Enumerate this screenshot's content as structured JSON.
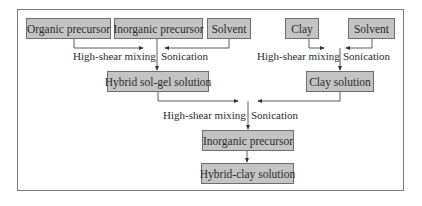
{
  "diagram": {
    "type": "flowchart",
    "nodes": {
      "organic_precursor": "Organic precursor",
      "inorganic_precursor_top": "Inorganic precursor",
      "solvent_left": "Solvent",
      "clay": "Clay",
      "solvent_right": "Solvent",
      "hybrid_sol_gel_solution": "Hybrid sol-gel solution",
      "clay_solution": "Clay solution",
      "inorganic_precursor_bottom": "Inorganic precursor",
      "hybrid_clay_solution": "Hybrid-clay solution"
    },
    "edge_labels": {
      "left_mixing": "High-shear mixing",
      "left_sonication": "Sonication",
      "right_mixing": "High-shear mixing",
      "right_sonication": "Sonication",
      "center_mixing": "High-shear mixing",
      "center_sonication": "Sonication"
    },
    "colors": {
      "box_fill": "#c4c4c4",
      "box_border": "#6e6e6e",
      "line": "#333333",
      "frame": "#7a7a7a"
    }
  }
}
